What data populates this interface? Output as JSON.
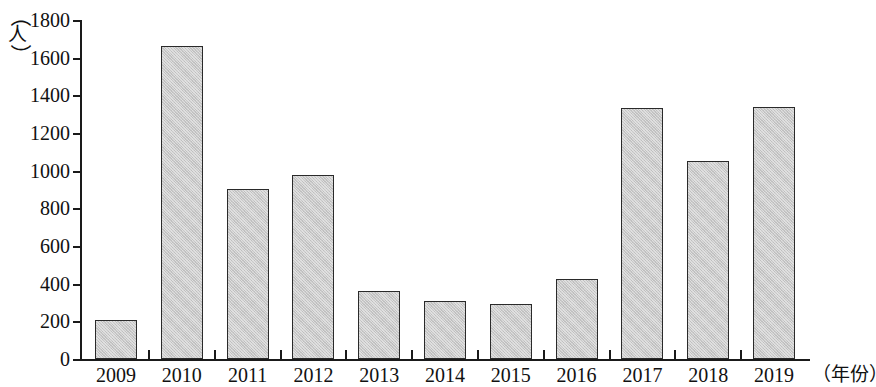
{
  "chart_data": {
    "type": "bar",
    "title": "",
    "subtitle": "",
    "xlabel": "（年份）",
    "ylabel": "（人）",
    "ylabel_chars": [
      "（",
      "人",
      "）"
    ],
    "categories": [
      "2009",
      "2010",
      "2011",
      "2012",
      "2013",
      "2014",
      "2015",
      "2016",
      "2017",
      "2018",
      "2019"
    ],
    "values": [
      205,
      1663,
      905,
      975,
      363,
      308,
      290,
      426,
      1332,
      1053,
      1337
    ],
    "ylim": [
      0,
      1800
    ],
    "ytick_labels": [
      "1800",
      "1600",
      "1400",
      "1200",
      "1000",
      "800",
      "600",
      "400",
      "200",
      "0"
    ],
    "ytick_values": [
      1800,
      1600,
      1400,
      1200,
      1000,
      800,
      600,
      400,
      200,
      0
    ],
    "ytick_step": 200,
    "grid": false,
    "legend": false,
    "legend_position": "none",
    "bar_fill_color": "#c9c9c9",
    "bar_edge_color": "#2a2a2a",
    "axis_color": "#1a1a1a",
    "background_color": "#ffffff"
  }
}
